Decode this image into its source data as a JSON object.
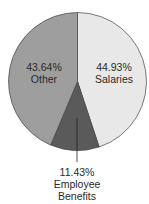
{
  "chart_data": {
    "type": "pie",
    "title": "",
    "slices": [
      {
        "label": "Salaries",
        "value": 44.93,
        "display": "44.93%",
        "color": "#e8e8e8"
      },
      {
        "label": "Employee Benefits",
        "value": 11.43,
        "display": "11.43%",
        "color": "#5a5a5a"
      },
      {
        "label": "Other",
        "value": 43.64,
        "display": "43.64%",
        "color": "#9e9e9e"
      }
    ],
    "start_angle_deg": 0,
    "direction": "clockwise",
    "legend": "none",
    "stroke_color": "#444444"
  },
  "labels": {
    "salaries_pct": "44.93%",
    "salaries_name": "Salaries",
    "benefits_pct": "11.43%",
    "benefits_name_1": "Employee",
    "benefits_name_2": "Benefits",
    "other_pct": "43.64%",
    "other_name": "Other"
  }
}
